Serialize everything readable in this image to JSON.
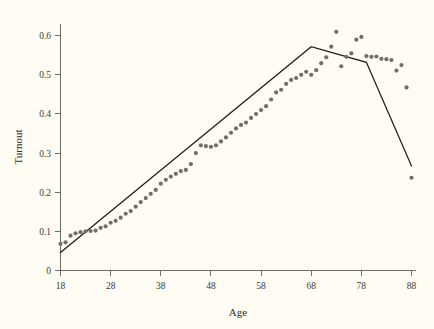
{
  "chart_data": {
    "type": "scatter",
    "title": "",
    "subtitle": "",
    "xlabel": "Age",
    "ylabel": "Turnout",
    "xlim": [
      18,
      88
    ],
    "ylim": [
      0,
      0.63
    ],
    "grid": false,
    "legend": null,
    "x_ticks": [
      18,
      28,
      38,
      48,
      58,
      68,
      78,
      88
    ],
    "x_tick_labels": [
      "18",
      "28",
      "38",
      "48",
      "58",
      "68",
      "78",
      "88"
    ],
    "y_ticks": [
      0,
      0.1,
      0.2,
      0.3,
      0.4,
      0.5,
      0.6
    ],
    "y_tick_labels": [
      "0",
      "0.1",
      "0.2",
      "0.3",
      "0.4",
      "0.5",
      "0.6"
    ],
    "marker_color": "#6f6f6b",
    "line_color": "#1d1d1b",
    "background_color": "#fffdf3",
    "series": [
      {
        "name": "Turnout by age",
        "type": "scatter",
        "x": [
          18,
          19,
          20,
          21,
          22,
          23,
          24,
          25,
          26,
          27,
          28,
          29,
          30,
          31,
          32,
          33,
          34,
          35,
          36,
          37,
          38,
          39,
          40,
          41,
          42,
          43,
          44,
          45,
          46,
          47,
          48,
          49,
          50,
          51,
          52,
          53,
          54,
          55,
          56,
          57,
          58,
          59,
          60,
          61,
          62,
          63,
          64,
          65,
          66,
          67,
          68,
          69,
          70,
          71,
          72,
          73,
          74,
          75,
          76,
          77,
          78,
          79,
          80,
          81,
          82,
          83,
          84,
          85,
          86,
          87,
          88
        ],
        "y": [
          0.068,
          0.072,
          0.089,
          0.095,
          0.098,
          0.1,
          0.101,
          0.102,
          0.109,
          0.113,
          0.122,
          0.127,
          0.135,
          0.145,
          0.152,
          0.163,
          0.175,
          0.185,
          0.196,
          0.206,
          0.222,
          0.232,
          0.24,
          0.247,
          0.254,
          0.257,
          0.272,
          0.3,
          0.32,
          0.318,
          0.316,
          0.32,
          0.33,
          0.34,
          0.352,
          0.363,
          0.372,
          0.378,
          0.39,
          0.4,
          0.41,
          0.42,
          0.437,
          0.455,
          0.462,
          0.477,
          0.487,
          0.492,
          0.5,
          0.508,
          0.5,
          0.512,
          0.53,
          0.545,
          0.572,
          0.61,
          0.522,
          0.546,
          0.555,
          0.59,
          0.597,
          0.548,
          0.546,
          0.547,
          0.541,
          0.54,
          0.538,
          0.511,
          0.525,
          0.468,
          0.237
        ]
      },
      {
        "name": "Piecewise linear fit",
        "type": "line",
        "x": [
          18,
          68,
          79,
          88
        ],
        "y": [
          0.046,
          0.572,
          0.532,
          0.267
        ]
      }
    ],
    "annotations": []
  },
  "axes": {
    "x_title": "Age",
    "y_title": "Turnout"
  }
}
